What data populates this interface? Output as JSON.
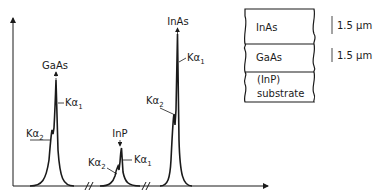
{
  "spectrum": {
    "peaks": [
      {
        "name": "GaAs",
        "ka1_label": "Kα",
        "ka1_sub": "1",
        "ka2_label": "Kα",
        "ka2_sub": "2"
      },
      {
        "name": "InP",
        "ka1_label": "Kα",
        "ka1_sub": "1",
        "ka2_label": "Kα",
        "ka2_sub": "2"
      },
      {
        "name": "InAs",
        "ka1_label": "Kα",
        "ka1_sub": "1",
        "ka2_label": "Kα",
        "ka2_sub": "2"
      }
    ]
  },
  "layer_stack": {
    "layers": [
      {
        "label": "InAs",
        "thickness": "1.5 µm"
      },
      {
        "label": "GaAs",
        "thickness": "1.5 µm"
      },
      {
        "label_line1": "(InP)",
        "label_line2": "substrate"
      }
    ]
  },
  "colors": {
    "ink": "#1a1a1a",
    "background": "#ffffff"
  }
}
